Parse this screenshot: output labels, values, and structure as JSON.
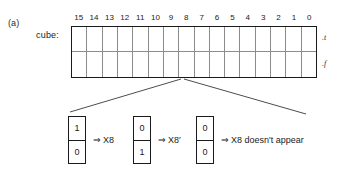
{
  "figure": {
    "panel_label": "(a)",
    "row_label": "cube:"
  },
  "cube": {
    "indices": [
      "15",
      "14",
      "13",
      "12",
      "11",
      "10",
      "9",
      "8",
      "7",
      "6",
      "5",
      "4",
      "3",
      "2",
      "1",
      "0"
    ],
    "row_annotations": {
      "top": ".t",
      "bottom": ".f"
    },
    "rows": [
      [
        "",
        "",
        "",
        "",
        "",
        "",
        "",
        "",
        "",
        "",
        "",
        "",
        "",
        "",
        "",
        ""
      ],
      [
        "",
        "",
        "",
        "",
        "",
        "",
        "",
        "",
        "",
        "",
        "",
        "",
        "",
        "",
        "",
        ""
      ]
    ]
  },
  "cases": [
    {
      "upper_bit": "1",
      "lower_bit": "0",
      "arrow": "⇒",
      "meaning": "X8"
    },
    {
      "upper_bit": "0",
      "lower_bit": "1",
      "arrow": "⇒",
      "meaning": "X8′"
    },
    {
      "upper_bit": "0",
      "lower_bit": "0",
      "arrow": "⇒",
      "meaning": "X8 doesn't appear"
    }
  ],
  "colors": {
    "ink": "#1a1a1a",
    "grid_inner": "#8c8c8c",
    "leader_line": "#4d4d4d",
    "background": "#ffffff"
  }
}
